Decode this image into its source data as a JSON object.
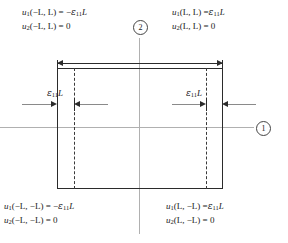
{
  "figure": {
    "type": "mechanics-schematic"
  },
  "equations": {
    "top_left": {
      "line1": "u₁(−L, L) = −ε₁₁L",
      "line2": "u₂(−L, L) = 0",
      "l1_fn": "u",
      "l1_fn_sub": "1",
      "l1_args": "(−L, L)",
      "l1_eq": "= −",
      "l1_eps": "ε",
      "l1_eps_sub": "11",
      "l1_tail": "L",
      "l2_fn": "u",
      "l2_fn_sub": "2",
      "l2_args": "(−L, L)",
      "l2_rhs": "= 0"
    },
    "top_right": {
      "line1": "u₁(L, L) = ε₁₁L",
      "line2": "u₂(L, L) = 0",
      "l1_fn": "u",
      "l1_fn_sub": "1",
      "l1_args": "(L, L)",
      "l1_eq": "=",
      "l1_eps": "ε",
      "l1_eps_sub": "11",
      "l1_tail": "L",
      "l2_fn": "u",
      "l2_fn_sub": "2",
      "l2_args": "(L, L)",
      "l2_rhs": "= 0"
    },
    "bottom_left": {
      "line1": "u₁(−L, −L) = −ε₁₁L",
      "line2": "u₂(−L, −L) = 0",
      "l1_fn": "u",
      "l1_fn_sub": "1",
      "l1_args": "(−L, −L)",
      "l1_eq": "= −",
      "l1_eps": "ε",
      "l1_eps_sub": "11",
      "l1_tail": "L",
      "l2_fn": "u",
      "l2_fn_sub": "2",
      "l2_args": "(−L, −L)",
      "l2_rhs": "= 0"
    },
    "bottom_right": {
      "line1": "u₁(L, −L) = ε₁₁L",
      "line2": "u₂(L, −L) = 0",
      "l1_fn": "u",
      "l1_fn_sub": "1",
      "l1_args": "(L, −L)",
      "l1_eq": "=",
      "l1_eps": "ε",
      "l1_eps_sub": "11",
      "l1_tail": "L",
      "l2_fn": "u",
      "l2_fn_sub": "2",
      "l2_args": "(L, −L)",
      "l2_rhs": "= 0"
    }
  },
  "axes": {
    "axis_1_label": "1",
    "axis_2_label": "2",
    "axis_1_name": "horizontal-axis",
    "axis_2_name": "vertical-axis",
    "color": "#b0b0b0"
  },
  "dimensions": {
    "left_gap_label": {
      "eps": "ε",
      "sub": "11",
      "tail": "L",
      "text": "ε₁₁L"
    },
    "right_gap_label": {
      "eps": "ε",
      "sub": "11",
      "tail": "L",
      "text": "ε₁₁L"
    }
  },
  "geometry": {
    "deformed_outline": "solid rectangle",
    "original_outline": "dashed vertical lines",
    "solid_color": "#2b2b2b",
    "dashed_color": "#3a3a3a"
  }
}
